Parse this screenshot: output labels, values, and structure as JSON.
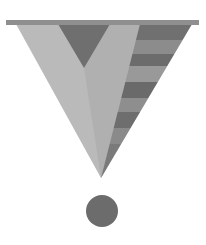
{
  "logo": {
    "description": "Inverted triangle with V notch, striped right face, and dot below",
    "colors": {
      "background": "#ffffff",
      "top_bar": "#8f8f8f",
      "triangle_light": "#b9b9b9",
      "triangle_mid": "#a8a8a8",
      "notch_dark": "#6e6e6e",
      "stripe_dark": "#6a6a6a",
      "stripe_light": "#8a8a8a",
      "dot": "#6c6c6c"
    }
  }
}
